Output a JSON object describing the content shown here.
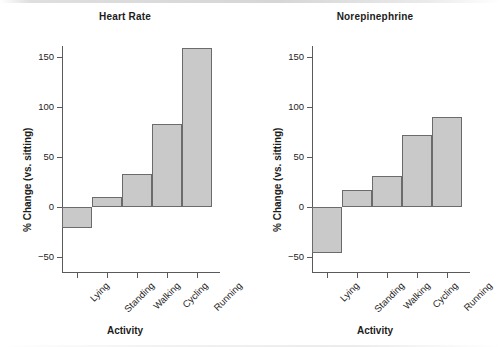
{
  "figure": {
    "background_color": "#ffffff",
    "bar_fill_color": "#c9c9c9",
    "bar_border_color": "#6b6b6b",
    "axis_color": "#5a5a5a",
    "text_color": "#1c1c1c"
  },
  "panels": [
    {
      "key": "heart_rate",
      "title": "Heart Rate",
      "xlabel": "Activity",
      "ylabel": "% Change (vs. sitting)",
      "yticks": [
        "150",
        "100",
        "50",
        "0",
        "-50"
      ],
      "xticks": [
        "Lying",
        "Standing",
        "Walking",
        "Cycling",
        "Running"
      ]
    },
    {
      "key": "norepinephrine",
      "title": "Norepinephrine",
      "xlabel": "Activity",
      "ylabel": "% Change (vs. sitting)",
      "yticks": [
        "150",
        "100",
        "50",
        "0",
        "-50"
      ],
      "xticks": [
        "Lying",
        "Standing",
        "Walking",
        "Cycling",
        "Running"
      ]
    }
  ],
  "chart_data": [
    {
      "type": "bar",
      "title": "Heart Rate",
      "xlabel": "Activity",
      "ylabel": "% Change (vs. sitting)",
      "categories": [
        "Lying",
        "Standing",
        "Walking",
        "Cycling",
        "Running"
      ],
      "values": [
        -21,
        10,
        33,
        83,
        159
      ],
      "ylim": [
        -62,
        172
      ],
      "yticks": [
        -50,
        0,
        50,
        100,
        150
      ],
      "grid": false,
      "legend": "none",
      "bar_gap": 0
    },
    {
      "type": "bar",
      "title": "Norepinephrine",
      "xlabel": "Activity",
      "ylabel": "% Change (vs. sitting)",
      "categories": [
        "Lying",
        "Standing",
        "Walking",
        "Cycling",
        "Running"
      ],
      "values": [
        -46,
        17,
        31,
        72,
        90
      ],
      "ylim": [
        -62,
        172
      ],
      "yticks": [
        -50,
        0,
        50,
        100,
        150
      ],
      "grid": false,
      "legend": "none",
      "bar_gap": 0
    }
  ]
}
